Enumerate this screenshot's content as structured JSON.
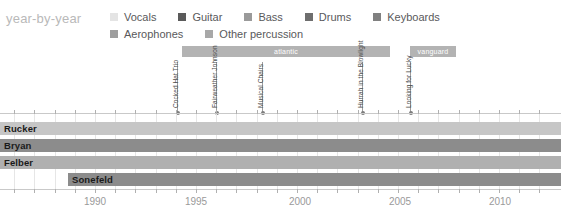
{
  "title": "year-by-year",
  "colors": {
    "background": "#ffffff",
    "title": "#b9b9b9",
    "legend_text": "#59595b",
    "label_bar": "#b3b3b3",
    "label_bar_text": "#ffffff",
    "grid": "#e6e6e6",
    "axis": "#c9c9c9",
    "tick": "#b0b0b0",
    "axis_label": "#9a9a9a",
    "annotation_text": "#4d4d4d",
    "annotation_stem": "#9d9d9d",
    "member_name": "#1a1a1a"
  },
  "legend": {
    "rows": [
      [
        {
          "label": "Vocals",
          "color": "#e4e4e4",
          "icon": "legend-swatch-icon"
        },
        {
          "label": "Guitar",
          "color": "#5a5a5a",
          "icon": "legend-swatch-icon"
        },
        {
          "label": "Bass",
          "color": "#9a9a9a",
          "icon": "legend-swatch-icon"
        },
        {
          "label": "Drums",
          "color": "#6e6e6e",
          "icon": "legend-swatch-icon"
        },
        {
          "label": "Keyboards",
          "color": "#808080",
          "icon": "legend-swatch-icon"
        }
      ],
      [
        {
          "label": "Aerophones",
          "color": "#9e9e9e",
          "icon": "legend-swatch-icon"
        },
        {
          "label": "Other percussion",
          "color": "#a8a8a8",
          "icon": "legend-swatch-icon"
        }
      ]
    ]
  },
  "label_bars": [
    {
      "name": "atlantic",
      "left": 182,
      "width": 208
    },
    {
      "name": "vanguard",
      "left": 410,
      "width": 46
    }
  ],
  "annotations": [
    {
      "text": "Cocked Hat Trio",
      "x": 177,
      "stem_top": 62,
      "stem_height": 52
    },
    {
      "text": "Fairweather Johnson",
      "x": 216,
      "stem_top": 62,
      "stem_height": 52
    },
    {
      "text": "Musical Chairs",
      "x": 262,
      "stem_top": 62,
      "stem_height": 52
    },
    {
      "text": "Hurrah in the Blowlight",
      "x": 362,
      "stem_top": 62,
      "stem_height": 52
    },
    {
      "text": "Looking for Lucky",
      "x": 410,
      "stem_top": 62,
      "stem_height": 52
    }
  ],
  "members": [
    {
      "name": "Rucker",
      "top": 12,
      "left": 0,
      "width": 561,
      "color": "#c6c6c6"
    },
    {
      "name": "Bryan",
      "top": 29,
      "left": 0,
      "width": 561,
      "color": "#8c8c8c"
    },
    {
      "name": "Felber",
      "top": 46,
      "left": 0,
      "width": 561,
      "color": "#b0b0b0"
    },
    {
      "name": "Sonefeld",
      "top": 63,
      "left": 68,
      "width": 493,
      "color": "#8c8c8c"
    }
  ],
  "xaxis": {
    "tick_years": [
      1986,
      1987,
      1988,
      1989,
      1990,
      1991,
      1992,
      1993,
      1994,
      1995,
      1996,
      1997,
      1998,
      1999,
      2000,
      2001,
      2002,
      2003,
      2004,
      2005,
      2006,
      2007,
      2008,
      2009,
      2010,
      2011,
      2012
    ],
    "labels": [
      {
        "text": "1990",
        "x": 95
      },
      {
        "text": "1995",
        "x": 196
      },
      {
        "text": "2000",
        "x": 300
      },
      {
        "text": "2005",
        "x": 400
      },
      {
        "text": "2010",
        "x": 500
      }
    ],
    "origin_x": 95,
    "origin_year": 1990,
    "px_per_year": 20.2
  },
  "chart_data": {
    "type": "bar",
    "title": "year-by-year",
    "xlabel": "",
    "ylabel": "",
    "xlim": [
      1986,
      2012
    ],
    "grid": true,
    "legend_position": "top",
    "categories": [
      "Rucker",
      "Bryan",
      "Felber",
      "Sonefeld"
    ],
    "series": [
      {
        "name": "Rucker",
        "start": 1986,
        "end": 2012,
        "instrument": "Vocals"
      },
      {
        "name": "Bryan",
        "start": 1986,
        "end": 2012,
        "instrument": "Guitar"
      },
      {
        "name": "Felber",
        "start": 1986,
        "end": 2012,
        "instrument": "Bass"
      },
      {
        "name": "Sonefeld",
        "start": 1989.4,
        "end": 2012,
        "instrument": "Drums"
      }
    ],
    "annotations": [
      {
        "label": "Cocked Hat Trio",
        "year": 1994.1
      },
      {
        "label": "Fairweather Johnson",
        "year": 1996.0
      },
      {
        "label": "Musical Chairs",
        "year": 1998.3
      },
      {
        "label": "Hurrah in the Blowlight",
        "year": 2003.2
      },
      {
        "label": "Looking for Lucky",
        "year": 2005.6
      }
    ],
    "label_periods": [
      {
        "label": "atlantic",
        "start": 1994.3,
        "end": 2004.6
      },
      {
        "label": "vanguard",
        "start": 2005.6,
        "end": 2007.9
      }
    ]
  }
}
